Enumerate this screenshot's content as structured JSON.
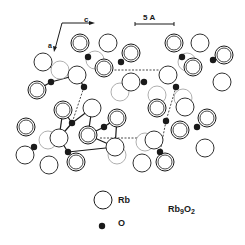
{
  "figure": {
    "title": "Rb9O2",
    "formula_main": "Rb",
    "formula_sub1": "9",
    "formula_mid": "O",
    "formula_sub2": "2"
  },
  "axes": {
    "c_label": "c",
    "a_label": "a"
  },
  "scale_bar": {
    "label": "5 A"
  },
  "legend": {
    "rb_label": "Rb",
    "o_label": "O"
  },
  "colors": {
    "ink": "#1a1a1a",
    "faint": "#9a9a9a",
    "background": "#ffffff"
  },
  "atoms": {
    "rb_double": [
      [
        80,
        43
      ],
      [
        131,
        53
      ],
      [
        104,
        68
      ],
      [
        174,
        43
      ],
      [
        193,
        67
      ],
      [
        224,
        55
      ],
      [
        37,
        90
      ],
      [
        63,
        110
      ],
      [
        117,
        118
      ],
      [
        88,
        135
      ],
      [
        157,
        108
      ],
      [
        180,
        130
      ],
      [
        207,
        118
      ],
      [
        26,
        127
      ],
      [
        76,
        162
      ],
      [
        165,
        162
      ]
    ],
    "rb_single": [
      [
        108,
        43
      ],
      [
        200,
        43
      ],
      [
        43,
        62
      ],
      [
        77,
        75
      ],
      [
        131,
        82
      ],
      [
        168,
        75
      ],
      [
        222,
        82
      ],
      [
        92,
        108
      ],
      [
        185,
        107
      ],
      [
        59,
        138
      ],
      [
        115,
        147
      ],
      [
        154,
        140
      ],
      [
        205,
        148
      ],
      [
        25,
        155
      ],
      [
        49,
        165
      ],
      [
        142,
        163
      ]
    ],
    "rb_faint": [
      [
        95,
        60
      ],
      [
        187,
        62
      ],
      [
        60,
        70
      ],
      [
        120,
        92
      ],
      [
        157,
        95
      ],
      [
        183,
        98
      ],
      [
        48,
        140
      ],
      [
        145,
        142
      ],
      [
        117,
        155
      ]
    ],
    "o": [
      [
        88,
        57
      ],
      [
        121,
        62
      ],
      [
        182,
        57
      ],
      [
        213,
        60
      ],
      [
        51,
        82
      ],
      [
        84,
        87
      ],
      [
        144,
        82
      ],
      [
        176,
        87
      ],
      [
        72,
        123
      ],
      [
        104,
        127
      ],
      [
        166,
        121
      ],
      [
        197,
        127
      ],
      [
        34,
        147
      ],
      [
        68,
        152
      ],
      [
        160,
        152
      ]
    ]
  },
  "bonds": {
    "solid": [
      [
        43,
        62,
        63,
        75
      ],
      [
        37,
        90,
        51,
        82
      ],
      [
        51,
        82,
        77,
        75
      ],
      [
        63,
        110,
        72,
        123
      ],
      [
        72,
        123,
        92,
        108
      ],
      [
        72,
        123,
        59,
        138
      ],
      [
        88,
        135,
        104,
        127
      ],
      [
        104,
        127,
        117,
        118
      ],
      [
        59,
        138,
        68,
        152
      ],
      [
        88,
        135,
        115,
        147
      ],
      [
        115,
        147,
        117,
        118
      ],
      [
        63,
        110,
        59,
        138
      ],
      [
        77,
        75,
        84,
        87
      ],
      [
        92,
        108,
        88,
        135
      ],
      [
        68,
        152,
        115,
        147
      ]
    ],
    "dashed": [
      [
        104,
        70,
        160,
        70
      ],
      [
        100,
        138,
        145,
        138
      ],
      [
        176,
        87,
        166,
        121
      ],
      [
        166,
        121,
        160,
        152
      ],
      [
        84,
        87,
        72,
        123
      ]
    ]
  }
}
